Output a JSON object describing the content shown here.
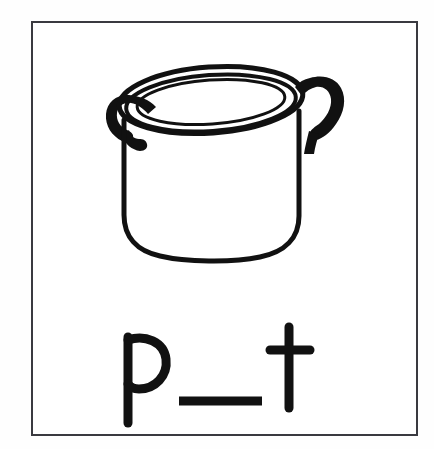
{
  "card": {
    "type": "phonics-picture-word-card",
    "border_color": "#3a3a40",
    "background_color": "#ffffff",
    "ink_color": "#111111"
  },
  "illustration": {
    "subject": "cooking pot",
    "icon_name": "pot-illustration",
    "description": "line drawing of a round cooking pot with two side loop handles and a wide rim",
    "style": "black outline clip art",
    "parts": [
      "rim-ellipse",
      "inner-opening-ellipse",
      "left-loop-handle",
      "right-loop-handle",
      "pot-body",
      "pot-bottom-curve"
    ]
  },
  "prompt": {
    "answer_word": "pot",
    "first_letter": "p",
    "blank": "___",
    "last_letter": "t",
    "full_text": "p ___ t",
    "missing_letter_slot_count": 1
  }
}
